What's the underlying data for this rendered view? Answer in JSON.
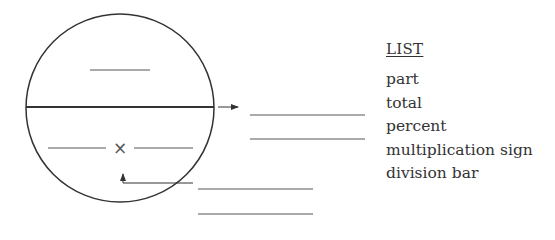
{
  "diagram": {
    "operator_symbol": "×",
    "colors": {
      "stroke": "#333333",
      "blank": "#555555"
    }
  },
  "list": {
    "title": "LIST",
    "items": [
      {
        "label": "part"
      },
      {
        "label": "total"
      },
      {
        "label": "percent"
      },
      {
        "label": "multiplication sign"
      },
      {
        "label": "division bar"
      }
    ]
  }
}
